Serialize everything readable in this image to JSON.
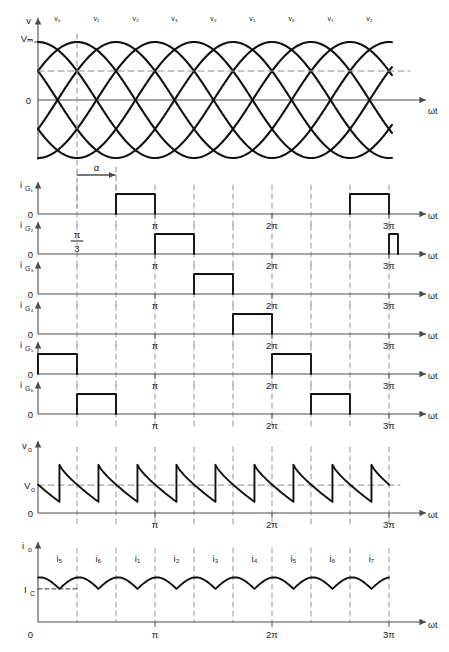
{
  "figure": {
    "x_axis_label": "ωt",
    "zero_label": "0",
    "alpha_label": "α",
    "pi_over_three_label": "π/3",
    "tick_labels": [
      "π",
      "2π",
      "3π"
    ],
    "line_color": "#111111",
    "axis_color": "#4d4d4d",
    "dashed_color": "#8c8c8c"
  },
  "chart_data": {
    "type": "line",
    "xlabel": "ωt",
    "xlim": [
      0,
      9.9
    ],
    "x_ticks": [
      3.14159,
      6.28318,
      9.42477
    ],
    "x_tick_labels": [
      "π",
      "2π",
      "3π"
    ],
    "grid": "dashed vertical lines every π/3",
    "firing_angle_alpha_deg": 60,
    "panels": [
      {
        "name": "source-voltages",
        "ylabel": "v",
        "y_tick_labels": [
          "Vₘ",
          "0"
        ],
        "ylim": [
          -1.15,
          1.15
        ],
        "type": "line",
        "description": "Six phase-displaced sinusoids, 60° apart, amplitude Vₘ",
        "n_sinusoids": 6,
        "phase_step_deg": 60,
        "amplitude": 1.0,
        "dashed_horizontal_level": 0.5,
        "dashed_vertical_at": 1.0472,
        "segment_labels": [
          "v₆",
          "v₁",
          "v₂",
          "v₃",
          "v₄",
          "v₅",
          "v₆",
          "v₁",
          "v₂"
        ],
        "segment_label_x": [
          0.52,
          1.57,
          2.62,
          3.66,
          4.71,
          5.76,
          6.81,
          7.85,
          8.9
        ]
      },
      {
        "name": "gate-pulse-1",
        "ylabel": "i",
        "ysub": "G₁",
        "zero_label": "0",
        "type": "pulse",
        "pulse_width_rad": 1.0472,
        "pulse_starts_rad": [
          2.0944,
          8.37758
        ],
        "x_tick_labels": [
          "π",
          "2π",
          "3π"
        ]
      },
      {
        "name": "gate-pulse-2",
        "ylabel": "i",
        "ysub": "G₂",
        "zero_label": "0",
        "type": "pulse",
        "pulse_width_rad": 1.0472,
        "pulse_starts_rad": [
          3.14159,
          9.42477
        ],
        "x_tick_labels": [
          "π",
          "2π",
          "3π"
        ]
      },
      {
        "name": "gate-pulse-3",
        "ylabel": "i",
        "ysub": "G₃",
        "zero_label": "0",
        "type": "pulse",
        "pulse_width_rad": 1.0472,
        "pulse_starts_rad": [
          4.18879
        ],
        "x_tick_labels": [
          "π",
          "2π",
          "3π"
        ]
      },
      {
        "name": "gate-pulse-4",
        "ylabel": "i",
        "ysub": "G₄",
        "zero_label": "0",
        "type": "pulse",
        "pulse_width_rad": 1.0472,
        "pulse_starts_rad": [
          5.23599
        ],
        "x_tick_labels": [
          "π",
          "2π",
          "3π"
        ]
      },
      {
        "name": "gate-pulse-5",
        "ylabel": "i",
        "ysub": "G₅",
        "zero_label": "0",
        "type": "pulse",
        "pulse_width_rad": 1.0472,
        "pulse_starts_rad": [
          0.0,
          6.28318
        ],
        "x_tick_labels": [
          "π",
          "2π",
          "3π"
        ]
      },
      {
        "name": "gate-pulse-6",
        "ylabel": "i",
        "ysub": "G₆",
        "zero_label": "0",
        "type": "pulse",
        "pulse_width_rad": 1.0472,
        "pulse_starts_rad": [
          1.0472,
          7.33038
        ],
        "x_tick_labels": [
          "π",
          "2π",
          "3π"
        ]
      },
      {
        "name": "output-voltage",
        "ylabel": "v",
        "ysub": "o",
        "y_tick_labels": [
          "Vₒ",
          "0"
        ],
        "type": "line",
        "description": "Six-pulse output voltage; each 60° segment decays then jumps at commutation",
        "average_level": 0.45,
        "segment_peak": 0.78,
        "segment_valley": 0.18,
        "n_segments": 9,
        "x_tick_labels": [
          "π",
          "2π",
          "3π"
        ]
      },
      {
        "name": "output-current",
        "ylabel": "i",
        "ysub": "o",
        "y_tick_labels": [
          "I_C",
          "0"
        ],
        "type": "line",
        "description": "Nearly continuous output current with small ripple at each commutation",
        "ripple_min": 0.46,
        "ripple_max": 0.62,
        "segment_labels": [
          "i₅",
          "i₆",
          "i₁",
          "i₂",
          "i₃",
          "i₄",
          "i₅",
          "i₆",
          "i₇"
        ],
        "x_tick_labels": [
          "π",
          "2π",
          "3π"
        ]
      }
    ]
  }
}
